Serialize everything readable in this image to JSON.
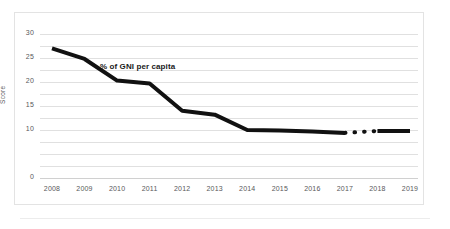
{
  "chart_data": {
    "type": "line",
    "title": "",
    "subtitle": "",
    "xlabel": "",
    "ylabel": "Score",
    "categories": [
      "2008",
      "2009",
      "2010",
      "2011",
      "2012",
      "2013",
      "2014",
      "2015",
      "2016",
      "2017",
      "2018",
      "2019"
    ],
    "x": [
      2008,
      2009,
      2010,
      2011,
      2012,
      2013,
      2014,
      2015,
      2016,
      2017,
      2018,
      2019
    ],
    "series": [
      {
        "name": "% of GNI per capita",
        "values": [
          27.0,
          24.8,
          20.3,
          19.7,
          14.0,
          13.2,
          10.0,
          9.9,
          9.7,
          9.4,
          9.8,
          9.8
        ],
        "color": "#111111",
        "line_width": 4,
        "style": "solid",
        "dashed_gap_between": [
          "2017",
          "2018"
        ],
        "annotation_label": "% of GNI per capita"
      }
    ],
    "yticks": [
      30,
      25,
      20,
      15,
      10,
      0
    ],
    "ytick_labels": [
      "30",
      "25",
      "20",
      "15",
      "10",
      "0"
    ],
    "xtick_labels": [
      "2008",
      "2009",
      "2010",
      "2011",
      "2012",
      "2013",
      "2014",
      "2015",
      "2016",
      "2017",
      "2018",
      "2019"
    ],
    "ylim": [
      0,
      31.5
    ],
    "xlim": [
      2007.7,
      2019.3
    ],
    "grid": true,
    "grid_color": "#e0e0e0",
    "legend": false,
    "legend_position": "none",
    "background_color": "#ffffff",
    "border_color": "#e3e3e3",
    "annotations": [
      {
        "text": "% of GNI per capita",
        "x": 2010.3,
        "y": 23.0
      }
    ]
  },
  "axes": {
    "y_title": "Score",
    "y_labels": [
      "30",
      "25",
      "20",
      "15",
      "10",
      "0"
    ],
    "x_labels": [
      "2008",
      "2009",
      "2010",
      "2011",
      "2012",
      "2013",
      "2014",
      "2015",
      "2016",
      "2017",
      "2018",
      "2019"
    ]
  },
  "annotation": {
    "series_label": "% of GNI per capita"
  }
}
